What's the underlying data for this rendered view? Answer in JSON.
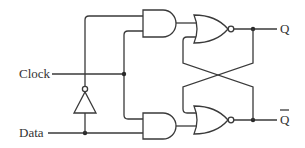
{
  "diagram": {
    "inputs": [
      {
        "id": "clock",
        "label": "Clock"
      },
      {
        "id": "data",
        "label": "Data"
      }
    ],
    "outputs": [
      {
        "id": "q",
        "label": "Q"
      },
      {
        "id": "q_bar",
        "label": "Q",
        "overline": true
      }
    ],
    "gates": [
      {
        "id": "and-top",
        "type": "AND"
      },
      {
        "id": "and-bottom",
        "type": "AND"
      },
      {
        "id": "nor-top",
        "type": "NOR"
      },
      {
        "id": "nor-bottom",
        "type": "NOR"
      },
      {
        "id": "inverter",
        "type": "NOT"
      }
    ],
    "colors": {
      "stroke": "#3a3a3a",
      "background": "#ffffff"
    }
  }
}
